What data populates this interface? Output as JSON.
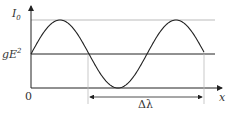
{
  "diagram": {
    "labels": {
      "y_axis_top": "I",
      "y_axis_top_sub": "0",
      "baseline_label": "gE",
      "baseline_sup": "2",
      "origin": "0",
      "x_axis": "x",
      "period": "Δλ"
    },
    "curve": {
      "type": "sinusoid",
      "baseline_y": 54,
      "amplitude_px": 34,
      "period_px": 116,
      "start_x": 31,
      "end_x": 204
    },
    "colors": {
      "curve": "#222222",
      "axis": "#222222",
      "max_line": "#aaaaaa",
      "guide_lines": "#bbbbbb"
    }
  }
}
